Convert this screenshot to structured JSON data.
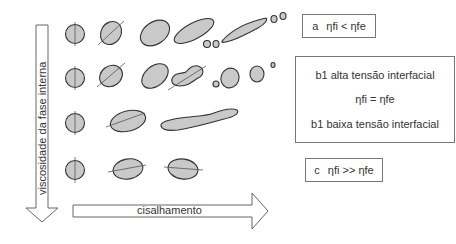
{
  "axes": {
    "vertical_label": "viscosidade da fase interna",
    "horizontal_label": "cisalhamento"
  },
  "cases": {
    "a": {
      "label": "a",
      "relation": "ηfi < ηfe"
    },
    "b": {
      "high_tension": "b1 alta tensão interfacial",
      "relation": "ηfi = ηfe",
      "low_tension": "b1 baixa tensão interfacial"
    },
    "c": {
      "label": "c",
      "relation": "ηfi >> ηfe"
    }
  },
  "colors": {
    "droplet_fill": "#c9c9c9",
    "outline": "#333333"
  }
}
